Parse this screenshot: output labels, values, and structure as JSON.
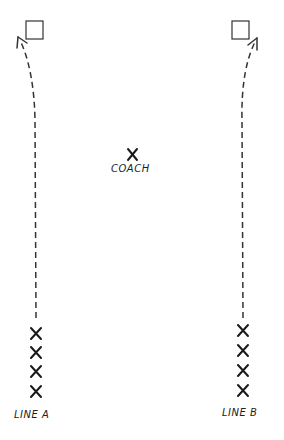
{
  "diagram": {
    "coach": {
      "marker": "X",
      "label": "COACH"
    },
    "lines": [
      {
        "id": "line-a",
        "label": "LINE A",
        "players": [
          "X",
          "X",
          "X",
          "X"
        ],
        "target": "cone"
      },
      {
        "id": "line-b",
        "label": "LINE B",
        "players": [
          "X",
          "X",
          "X",
          "X"
        ],
        "target": "cone"
      }
    ]
  }
}
